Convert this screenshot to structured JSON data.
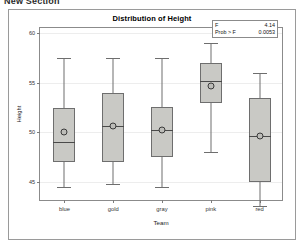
{
  "section": {
    "header": "New Section"
  },
  "chart_panel": {
    "title": "Distribution of Height"
  },
  "stats": {
    "f_label": "F",
    "f_value": "4.14",
    "prob_label": "Prob > F",
    "prob_value": "0.0053"
  },
  "chart_data": {
    "type": "box",
    "title": "Distribution of Height",
    "xlabel": "Team",
    "ylabel": "Height",
    "categories": [
      "blue",
      "gold",
      "gray",
      "pink",
      "red"
    ],
    "ylim": [
      43.0,
      60.5
    ],
    "yticks": [
      45,
      50,
      55,
      60
    ],
    "ytick_labels": [
      "45",
      "50",
      "55",
      "60"
    ],
    "grid": true,
    "legend": "none",
    "boxes": [
      {
        "category": "blue",
        "whisker_low": 44.5,
        "q1": 47.0,
        "median": 49.0,
        "q3": 52.5,
        "whisker_high": 57.5,
        "mean": 50.0
      },
      {
        "category": "gold",
        "whisker_low": 44.8,
        "q1": 47.0,
        "median": 50.6,
        "q3": 54.0,
        "whisker_high": 57.5,
        "mean": 50.6
      },
      {
        "category": "gray",
        "whisker_low": 44.5,
        "q1": 47.5,
        "median": 50.2,
        "q3": 52.6,
        "whisker_high": 57.5,
        "mean": 50.2
      },
      {
        "category": "pink",
        "whisker_low": 48.0,
        "q1": 53.0,
        "median": 55.2,
        "q3": 57.0,
        "whisker_high": 59.0,
        "mean": 54.7
      },
      {
        "category": "red",
        "whisker_low": 42.6,
        "q1": 45.0,
        "median": 49.6,
        "q3": 53.5,
        "whisker_high": 56.0,
        "mean": 49.6
      }
    ],
    "annotations": [
      {
        "label": "F",
        "value": "4.14"
      },
      {
        "label": "Prob > F",
        "value": "0.0053"
      }
    ]
  },
  "colors": {
    "box_fill": "#c9c9c5",
    "box_stroke": "#6e6e6e",
    "grid": "#ededed",
    "frame": "#8b8b8b",
    "panel_border": "#9a9a9a"
  }
}
